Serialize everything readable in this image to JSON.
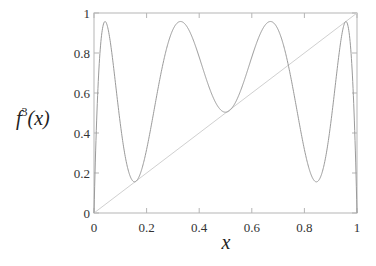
{
  "chart_data": {
    "type": "line",
    "title": "",
    "xlabel": "x",
    "ylabel": "f^3(x)",
    "ylabel_base": "f",
    "ylabel_sup": "3",
    "ylabel_arg": "(x)",
    "xlim": [
      0,
      1
    ],
    "ylim": [
      0,
      1
    ],
    "grid": false,
    "legend": "none",
    "x_ticks": [
      0,
      0.2,
      0.4,
      0.6,
      0.8,
      1
    ],
    "x_tick_labels": [
      "0",
      "0.2",
      "0.4",
      "0.6",
      "0.8",
      "1"
    ],
    "y_ticks": [
      0,
      0.2,
      0.4,
      0.6,
      0.8,
      1
    ],
    "y_tick_labels": [
      "0",
      "0.2",
      "0.4",
      "0.6",
      "0.8",
      "1"
    ],
    "series": [
      {
        "name": "f^3(x)",
        "description": "third iterate of logistic map f(x)=r x (1-x)",
        "r": 3.83,
        "color": "#9a9a9a",
        "x": [
          0,
          0.02,
          0.035,
          0.05,
          0.1,
          0.15,
          0.2,
          0.25,
          0.3,
          0.33,
          0.4,
          0.45,
          0.5,
          0.55,
          0.6,
          0.67,
          0.7,
          0.75,
          0.8,
          0.85,
          0.9,
          0.95,
          0.965,
          0.98,
          1
        ],
        "values": [
          0,
          0.75,
          0.95,
          0.88,
          0.33,
          0.18,
          0.36,
          0.76,
          0.94,
          0.95,
          0.77,
          0.62,
          0.57,
          0.62,
          0.77,
          0.95,
          0.94,
          0.76,
          0.36,
          0.18,
          0.33,
          0.88,
          0.95,
          0.75,
          0
        ]
      },
      {
        "name": "y = x",
        "color": "#d0d0d0",
        "x": [
          0,
          1
        ],
        "values": [
          0,
          1
        ]
      }
    ]
  }
}
